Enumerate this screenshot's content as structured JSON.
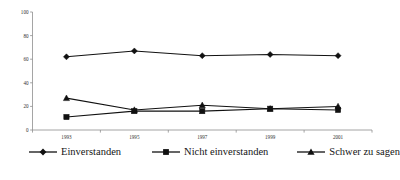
{
  "chart_data": {
    "type": "line",
    "title": "",
    "subtitle": "",
    "xlabel": "",
    "ylabel": "",
    "categories": [
      "1993",
      "1995",
      "1997",
      "1999",
      "2001"
    ],
    "series": [
      {
        "name": "Einverstanden",
        "marker": "diamond",
        "color": "#111111",
        "values": [
          62,
          67,
          63,
          64,
          63
        ]
      },
      {
        "name": "Nicht einverstanden",
        "marker": "square",
        "color": "#111111",
        "values": [
          11,
          16,
          16,
          18,
          17
        ]
      },
      {
        "name": "Schwer zu sagen",
        "marker": "triangle",
        "color": "#111111",
        "values": [
          27,
          17,
          21,
          18,
          20
        ]
      }
    ],
    "ylim": [
      0,
      100
    ],
    "yticks": [
      0,
      20,
      40,
      60,
      80,
      100
    ],
    "ytick_labels": [
      "0",
      "20",
      "40",
      "60",
      "80",
      "100"
    ],
    "grid": false,
    "legend_position": "bottom"
  },
  "legend": {
    "entries": [
      {
        "label": "Einverstanden"
      },
      {
        "label": "Nicht einverstanden"
      },
      {
        "label": "Schwer zu sagen"
      }
    ]
  },
  "axes": {
    "y_tick_labels": [
      "100",
      "80",
      "60",
      "40",
      "20",
      "0"
    ],
    "x_tick_labels": [
      "1993",
      "1995",
      "1997",
      "1999",
      "2001"
    ]
  },
  "colors": {
    "series": "#111111",
    "axis": "#8e8e8e",
    "text": "#1a1a1a",
    "background": "#ffffff"
  }
}
